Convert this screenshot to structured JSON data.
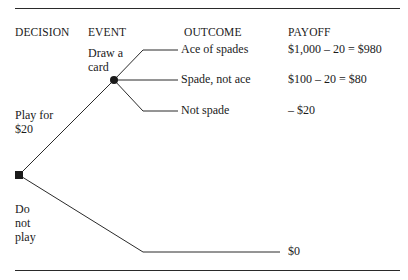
{
  "headers": {
    "decision": "DECISION",
    "event": "EVENT",
    "outcome": "OUTCOME",
    "payoff": "PAYOFF"
  },
  "decision_node": {
    "type": "square",
    "options": [
      {
        "label_line1": "Play for",
        "label_line2": "$20"
      },
      {
        "label_line1": "Do",
        "label_line2": "not",
        "label_line3": "play"
      }
    ]
  },
  "event_node": {
    "type": "circle",
    "label_line1": "Draw a",
    "label_line2": "card"
  },
  "outcomes": [
    {
      "label": "Ace of spades",
      "payoff": "$1,000 – 20 = $980"
    },
    {
      "label": "Spade, not ace",
      "payoff": "$100 – 20 = $80"
    },
    {
      "label": "Not spade",
      "payoff": "– $20"
    }
  ],
  "no_play_payoff": "$0",
  "colors": {
    "ink": "#1a1a1a",
    "background": "#ffffff"
  }
}
